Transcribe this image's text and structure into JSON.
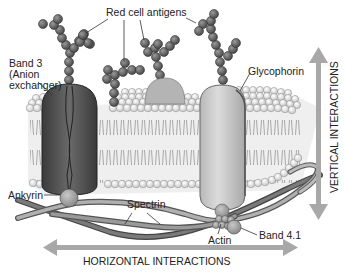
{
  "diagram": {
    "labels": {
      "red_cell_antigens": "Red cell antigens",
      "band3_line1": "Band 3",
      "band3_line2": "(Anion",
      "band3_line3": "exchanger)",
      "glycophorin": "Glycophorin",
      "ankyrin": "Ankyrin",
      "spectrin": "Spectrin",
      "actin": "Actin",
      "band41": "Band 4.1",
      "horizontal": "HORIZONTAL INTERACTIONS",
      "vertical": "VERTICAL INTERACTIONS"
    },
    "components": [
      {
        "name": "Band 3",
        "type": "transmembrane-protein",
        "shade": "dark"
      },
      {
        "name": "Glycophorin",
        "type": "transmembrane-protein",
        "shade": "light"
      },
      {
        "name": "Ankyrin",
        "type": "linker-sphere"
      },
      {
        "name": "Spectrin",
        "type": "filament"
      },
      {
        "name": "Actin",
        "type": "cluster"
      },
      {
        "name": "Band 4.1",
        "type": "sphere"
      },
      {
        "name": "Red cell antigens",
        "type": "carbohydrate-chain"
      }
    ],
    "colors": {
      "bead": "#6a6a6a",
      "band3": "#4a4a4a",
      "glycophorin": "#c8c8c8",
      "lipid_head": "#e8e8e8",
      "arrow": "#a8a8a8",
      "spectrin_dark": "#555555",
      "spectrin_light": "#a0a0a0"
    }
  }
}
